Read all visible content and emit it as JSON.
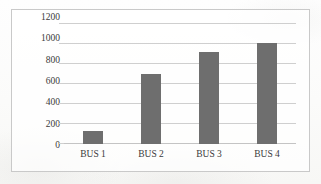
{
  "chart_data": {
    "type": "bar",
    "title": "",
    "subtitle": "",
    "xlabel": "",
    "ylabel": "",
    "categories": [
      "BUS 1",
      "BUS 2",
      "BUS 3",
      "BUS 4"
    ],
    "values": [
      125,
      690,
      910,
      1005
    ],
    "series": [
      {
        "name": "",
        "values": [
          125,
          690,
          910,
          1005
        ]
      }
    ],
    "ylim": [
      0,
      1200
    ],
    "y_ticks": [
      0,
      200,
      400,
      600,
      800,
      1000,
      1200
    ],
    "y_tick_labels": [
      "0",
      "200",
      "400",
      "600",
      "800",
      "1000",
      "1200"
    ],
    "grid": "horizontal",
    "legend": "none",
    "annotations": [],
    "colors": {
      "bar_fill": "#6e6e6e",
      "gridline": "#cfcfcf",
      "frame_border": "#c9c9c9",
      "tick_text": "#3a3a3a",
      "plot_background": "#ffffff",
      "page_background": "#fdfdfc"
    }
  }
}
